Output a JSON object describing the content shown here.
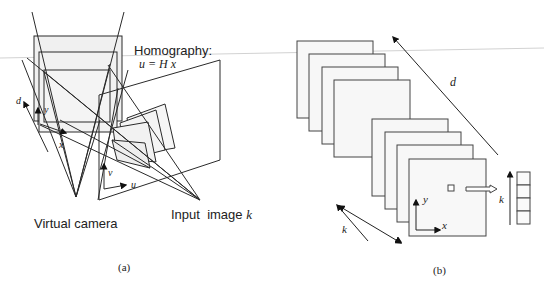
{
  "figure": {
    "panel_a": {
      "caption": "(a)",
      "homography_title": "Homography:",
      "homography_equation": "u = H x",
      "virtual_camera_label": "Virtual camera",
      "input_image_label": "Input  image ",
      "input_image_index": "k",
      "axis_labels": {
        "d": "d",
        "y": "y",
        "x": "x",
        "v": "v",
        "u": "u"
      }
    },
    "panel_b": {
      "caption": "(b)",
      "axis_labels": {
        "d": "d",
        "y": "y",
        "x": "x",
        "k_stack": "k",
        "k_vector": "k"
      },
      "stack_count": 8,
      "vector_cells": 4
    },
    "colors": {
      "line": "#2a2a2a",
      "plane_fill": "#f2f2f2",
      "plane_fill_light": "#f7f7f7",
      "background": "#ffffff",
      "artifact_line": "#cfcfcf"
    }
  }
}
